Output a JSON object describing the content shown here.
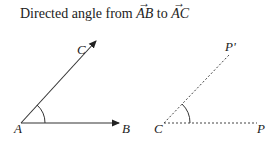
{
  "title": {
    "prefix": "Directed angle from ",
    "vec1": "AB",
    "middle": " to ",
    "vec2": "AC"
  },
  "left_figure": {
    "vertex_label": "A",
    "ray1_label": "B",
    "ray2_label": "C",
    "line_style": "solid with arrows"
  },
  "right_figure": {
    "vertex_label": "C",
    "ray1_label": "P",
    "ray2_label": "P'",
    "line_style": "dashed"
  }
}
